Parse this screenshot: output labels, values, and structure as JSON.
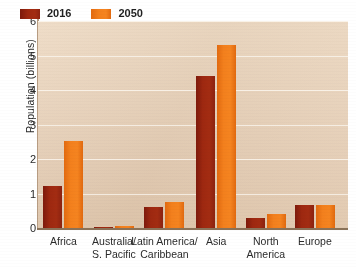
{
  "chart_data": {
    "type": "bar",
    "title": "",
    "xlabel": "",
    "ylabel": "Population (billions)",
    "ylim": [
      0,
      6
    ],
    "yticks": [
      0,
      1,
      2,
      3,
      4,
      5,
      6
    ],
    "ytick_labels": [
      "0",
      "1",
      "2",
      "3",
      "4",
      "5",
      "6"
    ],
    "grid": true,
    "grid_axis": "y",
    "legend_position": "upper left",
    "categories": [
      "Africa",
      "Australia/ S. Pacific",
      "Latin America/ Caribbean",
      "Asia",
      "North America",
      "Europe"
    ],
    "category_lines": [
      [
        "Africa"
      ],
      [
        "Australia/",
        "S. Pacific"
      ],
      [
        "Latin America/",
        "Caribbean"
      ],
      [
        "Asia"
      ],
      [
        "North",
        "America"
      ],
      [
        "Europe"
      ]
    ],
    "series": [
      {
        "name": "2016",
        "color": "#9e2810",
        "values": [
          1.22,
          0.04,
          0.62,
          4.4,
          0.3,
          0.68
        ]
      },
      {
        "name": "2050",
        "color": "#f3801d",
        "values": [
          2.53,
          0.06,
          0.75,
          5.3,
          0.4,
          0.67
        ]
      }
    ]
  },
  "axis": {
    "y_title": "Population (billions)"
  },
  "legend": {
    "entries": [
      {
        "label": "2016",
        "color": "#9e2810",
        "swatch_name": "legend-swatch-2016"
      },
      {
        "label": "2050",
        "color": "#f3801d",
        "swatch_name": "legend-swatch-2050"
      }
    ]
  },
  "colors": {
    "series_2016": "#9e2810",
    "series_2050": "#f3801d",
    "plot_background": "#e8d2ba",
    "gridline": "#fffcf6",
    "axis_line": "#8a7258",
    "text": "#2b2b2b",
    "page_background": "#ffffff"
  }
}
